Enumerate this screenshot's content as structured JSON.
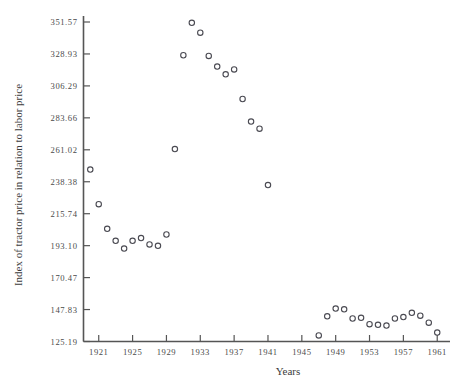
{
  "chart_data": {
    "type": "scatter",
    "title": "",
    "xlabel": "Years",
    "ylabel": "Index of tractor price in relation to labor price",
    "xlim": [
      1919.2,
      1961.8
    ],
    "ylim": [
      125.19,
      351.57
    ],
    "grid": false,
    "legend": null,
    "marker": "open-circle",
    "xticks": [
      1921,
      1925,
      1929,
      1933,
      1937,
      1941,
      1945,
      1949,
      1953,
      1957,
      1961
    ],
    "xtick_labels": [
      "1921",
      "1925",
      "1929",
      "1933",
      "1937",
      "1941",
      "1945",
      "1949",
      "1953",
      "1957",
      "1961"
    ],
    "yticks": [
      125.19,
      147.83,
      170.47,
      193.1,
      215.74,
      238.38,
      261.02,
      283.66,
      306.29,
      328.93,
      351.57
    ],
    "ytick_labels": [
      "125.19",
      "147.83",
      "170.47",
      "193.10",
      "215.74",
      "238.38",
      "261.02",
      "283.66",
      "306.29",
      "328.93",
      "351.57"
    ],
    "x": [
      1920,
      1921,
      1922,
      1923,
      1924,
      1925,
      1926,
      1927,
      1928,
      1929,
      1930,
      1931,
      1932,
      1933,
      1934,
      1935,
      1936,
      1937,
      1938,
      1939,
      1940,
      1941,
      1947,
      1948,
      1949,
      1950,
      1951,
      1952,
      1953,
      1954,
      1955,
      1956,
      1957,
      1958,
      1959,
      1960,
      1961
    ],
    "y": [
      247.0,
      222.5,
      205.0,
      196.5,
      191.0,
      196.5,
      198.5,
      194.0,
      193.0,
      201.0,
      261.5,
      328.0,
      351.0,
      344.0,
      327.5,
      320.0,
      314.5,
      318.0,
      297.0,
      281.0,
      276.0,
      236.0,
      129.5,
      143.0,
      148.5,
      148.0,
      141.5,
      142.0,
      137.5,
      137.0,
      136.5,
      141.5,
      142.5,
      145.5,
      143.5,
      138.5,
      131.5
    ],
    "points": [
      {
        "year": 1920,
        "index": 247.0
      },
      {
        "year": 1921,
        "index": 222.5
      },
      {
        "year": 1922,
        "index": 205.0
      },
      {
        "year": 1923,
        "index": 196.5
      },
      {
        "year": 1924,
        "index": 191.0
      },
      {
        "year": 1925,
        "index": 196.5
      },
      {
        "year": 1926,
        "index": 198.5
      },
      {
        "year": 1927,
        "index": 194.0
      },
      {
        "year": 1928,
        "index": 193.0
      },
      {
        "year": 1929,
        "index": 201.0
      },
      {
        "year": 1930,
        "index": 261.5
      },
      {
        "year": 1931,
        "index": 328.0
      },
      {
        "year": 1932,
        "index": 351.0
      },
      {
        "year": 1933,
        "index": 344.0
      },
      {
        "year": 1934,
        "index": 327.5
      },
      {
        "year": 1935,
        "index": 320.0
      },
      {
        "year": 1936,
        "index": 314.5
      },
      {
        "year": 1937,
        "index": 318.0
      },
      {
        "year": 1938,
        "index": 297.0
      },
      {
        "year": 1939,
        "index": 281.0
      },
      {
        "year": 1940,
        "index": 276.0
      },
      {
        "year": 1941,
        "index": 236.0
      },
      {
        "year": 1947,
        "index": 129.5
      },
      {
        "year": 1948,
        "index": 143.0
      },
      {
        "year": 1949,
        "index": 148.5
      },
      {
        "year": 1950,
        "index": 148.0
      },
      {
        "year": 1951,
        "index": 141.5
      },
      {
        "year": 1952,
        "index": 142.0
      },
      {
        "year": 1953,
        "index": 137.5
      },
      {
        "year": 1954,
        "index": 137.0
      },
      {
        "year": 1955,
        "index": 136.5
      },
      {
        "year": 1956,
        "index": 141.5
      },
      {
        "year": 1957,
        "index": 142.5
      },
      {
        "year": 1958,
        "index": 145.5
      },
      {
        "year": 1959,
        "index": 143.5
      },
      {
        "year": 1960,
        "index": 138.5
      },
      {
        "year": 1961,
        "index": 131.5
      }
    ],
    "colors": {
      "marker_stroke": "#4a4a52",
      "axis": "#555555",
      "text": "#3c3c3c",
      "background": "#ffffff"
    }
  }
}
